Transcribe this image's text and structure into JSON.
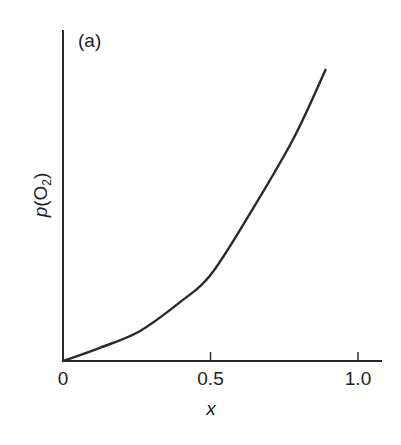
{
  "chart_data": {
    "type": "line",
    "title": "",
    "panel_label": "(a)",
    "xlabel": "x",
    "ylabel": "p(O2)",
    "ylabel_parts": {
      "p": "p",
      "open": "(O",
      "sub": "2",
      "close": ")"
    },
    "xlim": [
      0,
      1.08
    ],
    "ylim": [
      0,
      1
    ],
    "xticks": [
      0,
      0.5,
      1.0
    ],
    "xtick_labels": [
      "0",
      "0.5",
      "1.0"
    ],
    "yticks": [],
    "grid": false,
    "legend": null,
    "series": [
      {
        "name": "p(O2) vs x",
        "color": "#2a2a2a",
        "x": [
          0,
          0.125,
          0.26,
          0.4,
          0.5,
          0.63,
          0.78,
          0.89
        ],
        "y": [
          0,
          0.04,
          0.09,
          0.18,
          0.26,
          0.44,
          0.67,
          0.88
        ]
      }
    ]
  },
  "layout": {
    "origin_px": [
      63,
      361
    ],
    "x_unit_px": 295,
    "y_unit_px": 331,
    "x_axis_end_px": 382,
    "y_axis_top_px": 30,
    "tick_len_px": 9
  }
}
